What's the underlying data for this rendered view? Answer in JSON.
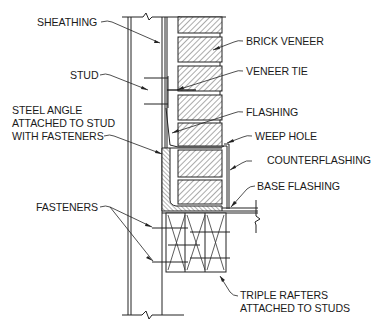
{
  "diagram": {
    "type": "construction-section-detail",
    "labels": {
      "sheathing": "SHEATHING",
      "stud": "STUD",
      "steel_angle_line1": "STEEL ANGLE",
      "steel_angle_line2": "ATTACHED TO STUD",
      "steel_angle_line3": "WITH FASTENERS",
      "fasteners": "FASTENERS",
      "brick_veneer": "BRICK VENEER",
      "veneer_tie": "VENEER TIE",
      "flashing": "FLASHING",
      "weep_hole": "WEEP HOLE",
      "counterflashing": "COUNTERFLASHING",
      "base_flashing": "BASE FLASHING",
      "triple_rafters_line1": "TRIPLE RAFTERS",
      "triple_rafters_line2": "ATTACHED TO STUDS"
    },
    "components": [
      "sheathing",
      "stud",
      "steel-angle",
      "fasteners",
      "brick-veneer",
      "veneer-tie",
      "flashing",
      "weep-hole",
      "counterflashing",
      "base-flashing",
      "triple-rafters"
    ],
    "colors": {
      "line": "#222222",
      "background": "#ffffff"
    }
  }
}
